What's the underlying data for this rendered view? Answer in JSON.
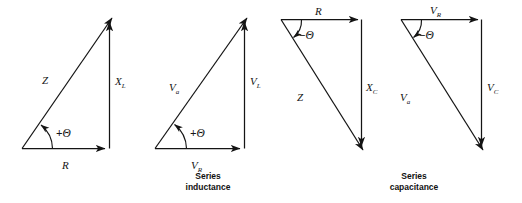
{
  "figure": {
    "background_color": "#ffffff",
    "stroke_color": "#141414",
    "width": 522,
    "height": 203
  },
  "groups": [
    {
      "id": "series-inductance",
      "caption_line1": "Series",
      "caption_line2": "inductance"
    },
    {
      "id": "series-capacitance",
      "caption_line1": "Series",
      "caption_line2": "capacitance"
    }
  ],
  "diagrams": [
    {
      "id": "impedance-triangle-inductive",
      "kind": "impedance",
      "angle_sign": "+",
      "angle_symbol": "Θ",
      "angle_text_sign": "+",
      "hypotenuse_label": "Z",
      "hypotenuse_sub": "",
      "horizontal_label": "R",
      "horizontal_sub": "",
      "vertical_label": "X",
      "vertical_sub": "L"
    },
    {
      "id": "voltage-triangle-inductive",
      "kind": "voltage",
      "angle_sign": "+",
      "angle_symbol": "Θ",
      "angle_text_sign": "+",
      "hypotenuse_label": "V",
      "hypotenuse_sub": "a",
      "horizontal_label": "V",
      "horizontal_sub": "R",
      "vertical_label": "V",
      "vertical_sub": "L"
    },
    {
      "id": "impedance-triangle-capacitive",
      "kind": "impedance",
      "angle_sign": "−",
      "angle_symbol": "Θ",
      "angle_text_sign": "−",
      "hypotenuse_label": "Z",
      "hypotenuse_sub": "",
      "horizontal_label": "R",
      "horizontal_sub": "",
      "vertical_label": "X",
      "vertical_sub": "C"
    },
    {
      "id": "voltage-triangle-capacitive",
      "kind": "voltage",
      "angle_sign": "−",
      "angle_symbol": "Θ",
      "angle_text_sign": "−",
      "hypotenuse_label": "V",
      "hypotenuse_sub": "a",
      "horizontal_label": "V",
      "horizontal_sub": "R",
      "vertical_label": "V",
      "vertical_sub": "C"
    }
  ]
}
